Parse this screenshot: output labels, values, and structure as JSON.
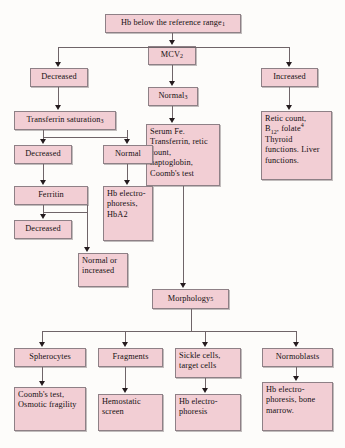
{
  "diagram": {
    "accent_color": "#f2ced4",
    "border_color": "#8e8086",
    "line_color": "#6f6468",
    "background_color": "#fdfcfa"
  },
  "nodes": {
    "root": "Hb below the reference range",
    "root_sup": "1",
    "mcv": "MCV",
    "mcv_sup": "2",
    "decreased_mcv": "Decreased",
    "increased_mcv": "Increased",
    "normal_mcv": "Normal",
    "normal_mcv_sup": "3",
    "transferrin": "Transferrin saturation",
    "transferrin_sup": "3",
    "transferrin_decreased": "Decreased",
    "transferrin_normal": "Normal",
    "ferritin": "Ferritin",
    "ferritin_decreased": "Decreased",
    "normal_or_increased": "Normal or increased",
    "hb_electrophoresis_hba2": "Hb electro-phoresis, HbA2",
    "serum_panel": "Serum Fe. Transferrin, retic count, haptoglobin, Coomb's test",
    "retic_panel_line1": "Retic count,",
    "retic_panel_b12": "B",
    "retic_panel_b12_sub": "12",
    "retic_panel_folate": ", folate",
    "retic_panel_folate_sup": "4",
    "retic_panel_rest": "Thyroid functions. Liver functions.",
    "morphology": "Morphology",
    "morphology_sup": "5",
    "spherocytes": "Spherocytes",
    "fragments": "Fragments",
    "sickle_cells": "Sickle cells, target cells",
    "normoblasts": "Normoblasts",
    "coombs_osmotic": "Coomb's test, Osmotic fragility",
    "hemostatic_screen": "Hemostatic screen",
    "hb_electrophoresis": "Hb electro-phoresis",
    "hb_electro_marrow": "Hb electro-phoresis, bone marrow."
  }
}
